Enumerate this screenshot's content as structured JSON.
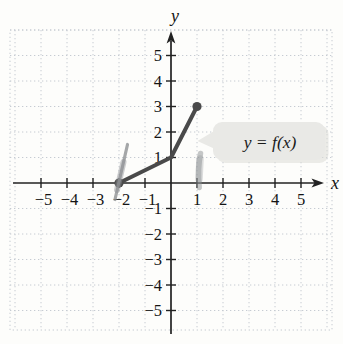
{
  "figure": {
    "colors": {
      "background": "#fdfdfb",
      "grid": "#c6cbd2",
      "axis": "#222222",
      "text": "#141414",
      "curve": "#4a4a4a",
      "pen_mark": "#8e9194",
      "callout_fill": "#e9e9e6",
      "callout_shadow": "#d9d9d4"
    },
    "axes": {
      "x_label": "x",
      "y_label": "y",
      "x_ticks": [
        {
          "v": -5,
          "label": "−5"
        },
        {
          "v": -4,
          "label": "−4"
        },
        {
          "v": -3,
          "label": "−3"
        },
        {
          "v": -2,
          "label": "−2"
        },
        {
          "v": -1,
          "label": "−1"
        },
        {
          "v": 1,
          "label": "1"
        },
        {
          "v": 2,
          "label": "2"
        },
        {
          "v": 3,
          "label": "3"
        },
        {
          "v": 4,
          "label": "4"
        },
        {
          "v": 5,
          "label": "5"
        }
      ],
      "y_ticks": [
        {
          "v": 5,
          "label": "5"
        },
        {
          "v": 4,
          "label": "4"
        },
        {
          "v": 3,
          "label": "3"
        },
        {
          "v": 2,
          "label": "2"
        },
        {
          "v": 1,
          "label": "1"
        },
        {
          "v": -1,
          "label": "−1"
        },
        {
          "v": -2,
          "label": "−2"
        },
        {
          "v": -3,
          "label": "−3"
        },
        {
          "v": -4,
          "label": "−4"
        },
        {
          "v": -5,
          "label": "−5"
        }
      ]
    },
    "callout": {
      "label": "y = f(x)"
    }
  },
  "chart_data": {
    "type": "line",
    "title": "",
    "xlabel": "x",
    "ylabel": "y",
    "xlim": [
      -6,
      6
    ],
    "ylim": [
      -6,
      6
    ],
    "grid": true,
    "legend": "none",
    "series": [
      {
        "name": "y = f(x)",
        "points": [
          [
            -2,
            0
          ],
          [
            0,
            1
          ],
          [
            1,
            3
          ]
        ],
        "endpoints": [
          {
            "x": -2,
            "y": 0,
            "style": "closed"
          },
          {
            "x": 1,
            "y": 3,
            "style": "closed"
          }
        ]
      }
    ],
    "annotations": [
      {
        "type": "callout",
        "text": "y = f(x)",
        "points_to": "curve segment near (1, 2)"
      },
      {
        "type": "pen-mark",
        "at": [
          -2,
          0
        ]
      },
      {
        "type": "pen-mark",
        "at": [
          1,
          0.5
        ]
      }
    ]
  }
}
